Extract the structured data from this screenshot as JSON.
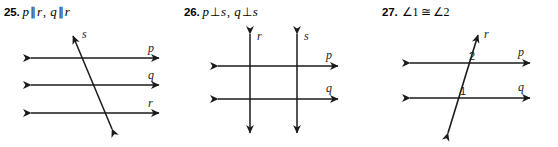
{
  "page": {
    "background": "#ffffff",
    "stroke_color": "#1a1a1a",
    "problem_count": 3
  },
  "problems": [
    {
      "number": "25.",
      "statement": {
        "part1_left": "p",
        "part1_symbol": "∥",
        "part1_right": "r",
        "separator": ",",
        "part2_left": "q",
        "part2_symbol": "∥",
        "part2_right": "r"
      },
      "figure": {
        "type": "three-parallel-lines-with-transversal",
        "line_labels": [
          "p",
          "q",
          "r",
          "s"
        ],
        "description": "Three horizontal double-arrow lines p, q, r crossed by a transversal s rising to the upper right"
      }
    },
    {
      "number": "26.",
      "statement": {
        "part1_left": "p",
        "part1_symbol": "⊥",
        "part1_right": "s",
        "separator": ",",
        "part2_left": "q",
        "part2_symbol": "⊥",
        "part2_right": "s"
      },
      "figure": {
        "type": "two-vertical-two-horizontal-grid",
        "line_labels": [
          "r",
          "s",
          "p",
          "q"
        ],
        "description": "Two vertical double-arrow lines r and s crossing two horizontal double-arrow lines p and q at right angles"
      }
    },
    {
      "number": "27.",
      "statement": {
        "part1_left": "∠1",
        "part1_symbol": "≅",
        "part1_right": "∠2"
      },
      "figure": {
        "type": "two-parallel-lines-with-transversal-and-angles",
        "line_labels": [
          "r",
          "p",
          "q"
        ],
        "angle_labels": [
          "2",
          "1"
        ],
        "description": "Transversal r crossing horizontal lines p and q, angle 2 above line p and angle 1 above line q"
      }
    }
  ]
}
